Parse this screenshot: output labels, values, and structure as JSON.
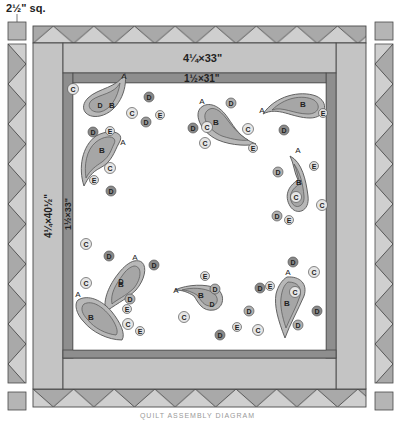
{
  "diagram": {
    "title": "Quilt Assembly Diagram",
    "caption": "QUILT ASSEMBLY DIAGRAM",
    "colors": {
      "background": "#ffffff",
      "outer_border": "#c4c4c4",
      "inner_border": "#8e8e8e",
      "pieced_dark": "#a9a9a9",
      "pieced_light": "#cfcfcf",
      "center": "#ffffff",
      "paisley_fill": "#b8b8b8",
      "paisley_inner": "#a6a6a6",
      "dot_light": "#e6e6e6",
      "dot_dark": "#8a8a8a",
      "line": "#4a4a4a"
    },
    "labels": {
      "corner_square": "2½\" sq.",
      "top_outer_border": "4¼×33\"",
      "top_inner_border": "1½×31\"",
      "side_outer_border": "4¼×40½\"",
      "side_inner_border": "1½×33\""
    },
    "appliques": {
      "shape_letters": [
        "A",
        "B",
        "C",
        "D",
        "E"
      ],
      "paisleys": [
        {
          "id": 1,
          "position": "top-left",
          "labels": [
            "A",
            "B",
            "D"
          ]
        },
        {
          "id": 2,
          "position": "top-center",
          "labels": [
            "A",
            "B",
            "C",
            "E"
          ]
        },
        {
          "id": 3,
          "position": "top-right",
          "labels": [
            "A",
            "B",
            "C",
            "E"
          ]
        },
        {
          "id": 4,
          "position": "left-upper",
          "labels": [
            "A",
            "B",
            "E"
          ]
        },
        {
          "id": 5,
          "position": "right-middle",
          "labels": [
            "A",
            "B",
            "C",
            "E"
          ]
        },
        {
          "id": 6,
          "position": "bottom-left-upper",
          "labels": [
            "A",
            "B",
            "D"
          ]
        },
        {
          "id": 7,
          "position": "bottom-left-lower",
          "labels": [
            "A",
            "B",
            "E"
          ]
        },
        {
          "id": 8,
          "position": "bottom-center",
          "labels": [
            "A",
            "B",
            "D",
            "E"
          ]
        },
        {
          "id": 9,
          "position": "bottom-right",
          "labels": [
            "A",
            "B",
            "C"
          ]
        }
      ]
    }
  }
}
